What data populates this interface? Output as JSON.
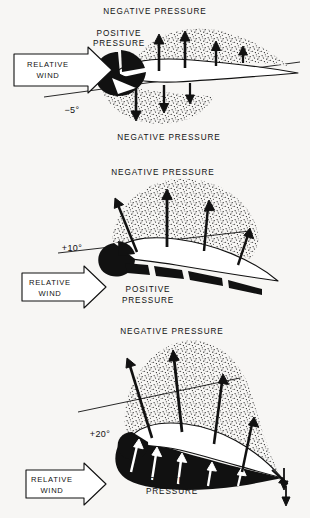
{
  "figure": {
    "background_color": "#f7f6f4",
    "ink_color": "#111111"
  },
  "panels": [
    {
      "id": "panel-neg5",
      "angle_label": "−5°",
      "angle_value": -5,
      "wind_label_line1": "RELATIVE",
      "wind_label_line2": "WIND",
      "label_top": "NEGATIVE  PRESSURE",
      "label_bottom": "NEGATIVE  PRESSURE",
      "label_positive_line1": "POSITIVE",
      "label_positive_line2": "PRESSURE",
      "positive_pressure_region": "leading-edge-wedge",
      "upper_arrow_direction": "up",
      "lower_arrow_direction": "down"
    },
    {
      "id": "panel-pos10",
      "angle_label": "+10°",
      "angle_value": 10,
      "wind_label_line1": "RELATIVE",
      "wind_label_line2": "WIND",
      "label_top": "NEGATIVE  PRESSURE",
      "label_positive_line1": "POSITIVE",
      "label_positive_line2": "PRESSURE",
      "positive_pressure_region": "lower-surface-band",
      "upper_arrow_direction": "up"
    },
    {
      "id": "panel-pos20",
      "angle_label": "+20°",
      "angle_value": 20,
      "wind_label_line1": "RELATIVE",
      "wind_label_line2": "WIND",
      "label_top": "NEGATIVE  PRESSURE",
      "label_positive_line1": "POSITIVE",
      "label_positive_line2": "PRESSURE",
      "positive_pressure_region": "lower-surface-thick-black",
      "upper_arrow_direction": "up"
    }
  ]
}
